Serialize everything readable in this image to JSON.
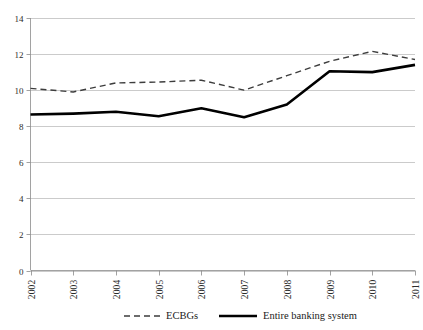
{
  "chart_data": {
    "type": "line",
    "title": "",
    "xlabel": "",
    "ylabel": "",
    "categories": [
      "2002",
      "2003",
      "2004",
      "2005",
      "2006",
      "2007",
      "2008",
      "2009",
      "2010",
      "2011"
    ],
    "series": [
      {
        "name": "ECBGs",
        "style": "dashed",
        "color": "#3d3d3d",
        "values": [
          10.1,
          9.9,
          10.4,
          10.45,
          10.55,
          10.0,
          10.8,
          11.6,
          12.15,
          11.7
        ]
      },
      {
        "name": "Entire banking system",
        "style": "solid",
        "color": "#000000",
        "values": [
          8.65,
          8.7,
          8.8,
          8.55,
          9.0,
          8.5,
          9.2,
          11.05,
          11.0,
          11.4
        ]
      }
    ],
    "ylim": [
      0,
      14
    ],
    "yticks": [
      0,
      2,
      4,
      6,
      8,
      10,
      12,
      14
    ],
    "ytick_labels": [
      "0",
      "2",
      "4",
      "6",
      "8",
      "10",
      "12",
      "14"
    ],
    "grid": true,
    "legend_position": "bottom",
    "axis_color": "#8a8a8a",
    "grid_color": "#b5b5b5"
  },
  "legend": {
    "entries": [
      {
        "label": "ECBGs",
        "style": "dashed"
      },
      {
        "label": "Entire banking system",
        "style": "solid"
      }
    ]
  }
}
